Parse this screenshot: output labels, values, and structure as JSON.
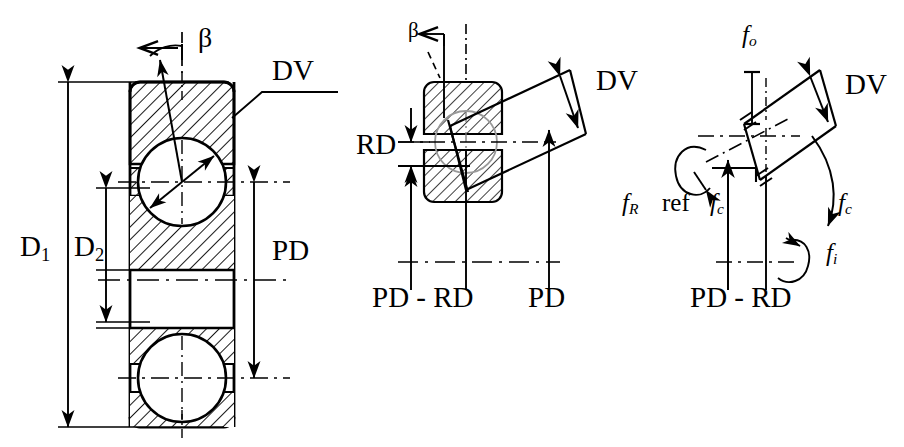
{
  "figure": {
    "type": "engineering-diagram",
    "background_color": "#ffffff",
    "line_color": "#000000",
    "hatch_color": "#000000",
    "panel_count": 3
  },
  "panels": [
    {
      "id": "panel-left",
      "name": "bearing-cross-section",
      "description": "Full radial cross-section of a ball bearing showing two balls, inner and outer rings with section hatching, and overall dimension arrows",
      "labels": {
        "beta": "β",
        "dv": "DV",
        "d1_base": "D",
        "d1_sub": "1",
        "d2_base": "D",
        "d2_sub": "2",
        "pd": "PD"
      }
    },
    {
      "id": "panel-middle",
      "name": "contact-angle-detail",
      "description": "Enlarged detail of one ball between raceways showing contact angle beta, the tilted DV line of action, the radial offset RD, and the PD and PD-RD reference arrows",
      "labels": {
        "beta": "β",
        "dv": "DV",
        "rd": "RD",
        "pd_minus_rd": "PD - RD",
        "pd": "PD"
      }
    },
    {
      "id": "panel-right",
      "name": "rotational-frequency-diagram",
      "description": "Kinematic diagram of the same contact showing outer-ring, inner-ring, cage and rolling-element rotation frequencies about the tilted contact axis",
      "labels": {
        "dv": "DV",
        "f_o_base": "f",
        "f_o_sub": "o",
        "f_R_base": "f",
        "f_R_sub": "R",
        "ref": "ref",
        "f_c_base": "f",
        "f_c_sub": "c",
        "f_c2_base": "f",
        "f_c2_sub": "c",
        "f_i_base": "f",
        "f_i_sub": "i",
        "pd_minus_rd": "PD - RD"
      }
    }
  ],
  "glossary": [
    {
      "symbol": "D₁",
      "meaning": "outer ring outside diameter"
    },
    {
      "symbol": "D₂",
      "meaning": "inner ring bore diameter"
    },
    {
      "symbol": "PD",
      "meaning": "pitch diameter"
    },
    {
      "symbol": "RD",
      "meaning": "radial offset / rolling element diameter term"
    },
    {
      "symbol": "DV",
      "meaning": "contact line of action length"
    },
    {
      "symbol": "β",
      "meaning": "contact angle"
    },
    {
      "symbol": "fₒ",
      "meaning": "outer ring rotational frequency"
    },
    {
      "symbol": "fᵢ",
      "meaning": "inner ring rotational frequency"
    },
    {
      "symbol": "f_c",
      "meaning": "cage rotational frequency"
    },
    {
      "symbol": "f_R",
      "meaning": "rolling element rotational frequency"
    },
    {
      "symbol": "ref",
      "meaning": "reference frame"
    }
  ]
}
